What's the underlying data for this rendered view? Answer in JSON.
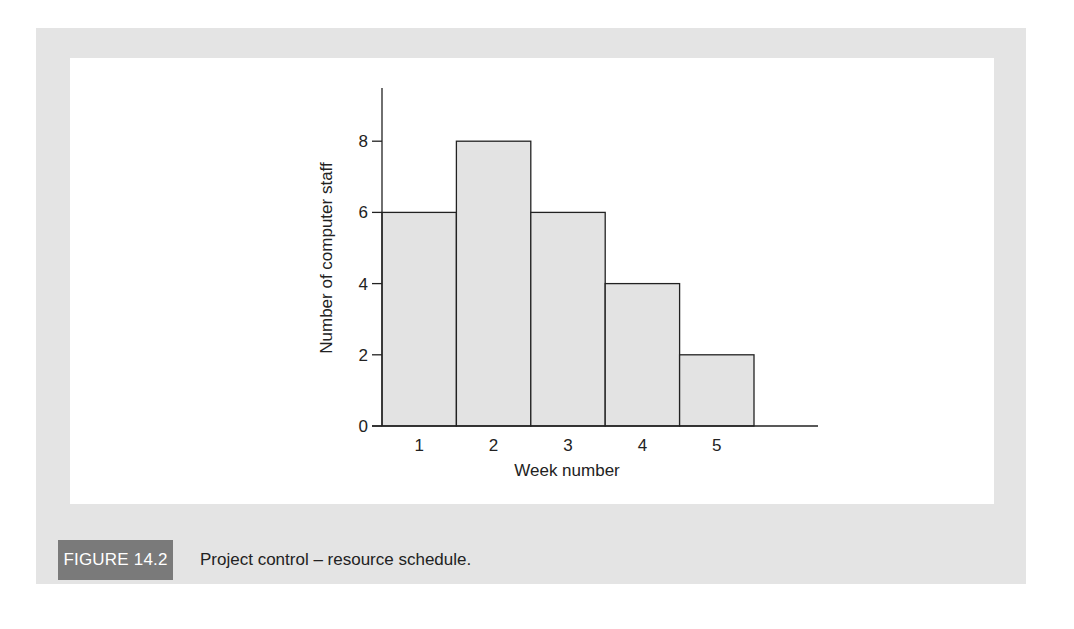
{
  "figure": {
    "label": "FIGURE 14.2",
    "caption": "Project control – resource schedule."
  },
  "colors": {
    "panel_bg": "#e4e4e4",
    "plot_bg": "#ffffff",
    "bar_fill": "#e3e3e3",
    "bar_stroke": "#222222",
    "badge_bg": "#7a7a7a"
  },
  "chart_data": {
    "type": "bar",
    "title": "",
    "xlabel": "Week number",
    "ylabel": "Number of computer staff",
    "categories": [
      "1",
      "2",
      "3",
      "4",
      "5"
    ],
    "values": [
      6,
      8,
      6,
      4,
      2
    ],
    "yticks": [
      0,
      2,
      4,
      6,
      8
    ],
    "ylim": [
      0,
      9.5
    ],
    "grid": false,
    "legend": null,
    "bar_gap": 0
  }
}
